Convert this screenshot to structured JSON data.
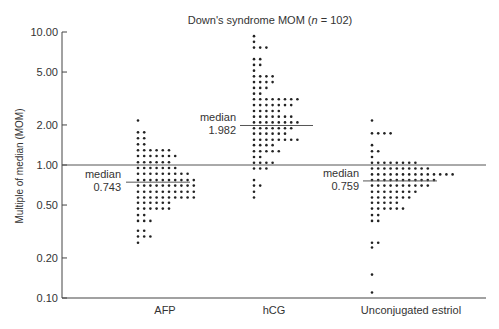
{
  "chart_data": {
    "type": "scatter",
    "subtype": "dot-strip (log scale)",
    "title": "Down's syndrome MOM (n = 102)",
    "title_parts": {
      "prefix": "Down's syndrome MOM (",
      "n": "n",
      "suffix": " = 102)"
    },
    "xlabel": "",
    "ylabel": "Multiple of median (MOM)",
    "yscale": "log",
    "ylim": [
      0.1,
      10.0
    ],
    "yticks": [
      10.0,
      5.0,
      2.0,
      1.0,
      0.5,
      0.2,
      0.1
    ],
    "ytick_labels": [
      "10.00",
      "5.00",
      "2.00",
      "1.00",
      "0.50",
      "0.20",
      "0.10"
    ],
    "reference_line": 1.0,
    "grid": false,
    "legend": null,
    "categories": [
      "AFP",
      "hCG",
      "Unconjugated estriol"
    ],
    "series": [
      {
        "name": "AFP",
        "median": 0.743,
        "median_label": "median",
        "median_value_label": "0.743",
        "rows": [
          {
            "value": 2.16,
            "count": 1
          },
          {
            "value": 1.76,
            "count": 2
          },
          {
            "value": 1.59,
            "count": 2
          },
          {
            "value": 1.43,
            "count": 2
          },
          {
            "value": 1.29,
            "count": 6
          },
          {
            "value": 1.17,
            "count": 7
          },
          {
            "value": 1.05,
            "count": 6
          },
          {
            "value": 0.95,
            "count": 7
          },
          {
            "value": 0.86,
            "count": 9
          },
          {
            "value": 0.77,
            "count": 10
          },
          {
            "value": 0.7,
            "count": 10
          },
          {
            "value": 0.63,
            "count": 10
          },
          {
            "value": 0.57,
            "count": 10
          },
          {
            "value": 0.52,
            "count": 6
          },
          {
            "value": 0.47,
            "count": 6
          },
          {
            "value": 0.42,
            "count": 2
          },
          {
            "value": 0.38,
            "count": 3
          },
          {
            "value": 0.32,
            "count": 2
          },
          {
            "value": 0.29,
            "count": 3
          },
          {
            "value": 0.26,
            "count": 1
          }
        ]
      },
      {
        "name": "hCG",
        "median": 1.982,
        "median_label": "median",
        "median_value_label": "1.982",
        "rows": [
          {
            "value": 9.31,
            "count": 1
          },
          {
            "value": 8.43,
            "count": 1
          },
          {
            "value": 7.63,
            "count": 3
          },
          {
            "value": 6.25,
            "count": 2
          },
          {
            "value": 5.66,
            "count": 2
          },
          {
            "value": 5.12,
            "count": 1
          },
          {
            "value": 4.64,
            "count": 4
          },
          {
            "value": 4.2,
            "count": 4
          },
          {
            "value": 3.8,
            "count": 3
          },
          {
            "value": 3.44,
            "count": 2
          },
          {
            "value": 3.12,
            "count": 8
          },
          {
            "value": 2.82,
            "count": 7
          },
          {
            "value": 2.55,
            "count": 5
          },
          {
            "value": 2.31,
            "count": 7
          },
          {
            "value": 2.09,
            "count": 8
          },
          {
            "value": 1.89,
            "count": 7
          },
          {
            "value": 1.72,
            "count": 6
          },
          {
            "value": 1.55,
            "count": 8
          },
          {
            "value": 1.41,
            "count": 4
          },
          {
            "value": 1.27,
            "count": 5
          },
          {
            "value": 1.15,
            "count": 2
          },
          {
            "value": 1.04,
            "count": 4
          },
          {
            "value": 0.94,
            "count": 3
          },
          {
            "value": 0.77,
            "count": 1
          },
          {
            "value": 0.7,
            "count": 2
          },
          {
            "value": 0.63,
            "count": 1
          },
          {
            "value": 0.57,
            "count": 1
          }
        ]
      },
      {
        "name": "Unconjugated estriol",
        "median": 0.759,
        "median_label": "median",
        "median_value_label": "0.759",
        "rows": [
          {
            "value": 2.16,
            "count": 1
          },
          {
            "value": 1.73,
            "count": 4
          },
          {
            "value": 1.41,
            "count": 1
          },
          {
            "value": 1.27,
            "count": 2
          },
          {
            "value": 1.15,
            "count": 1
          },
          {
            "value": 1.04,
            "count": 8
          },
          {
            "value": 0.94,
            "count": 10
          },
          {
            "value": 0.85,
            "count": 14
          },
          {
            "value": 0.77,
            "count": 11
          },
          {
            "value": 0.7,
            "count": 10
          },
          {
            "value": 0.63,
            "count": 8
          },
          {
            "value": 0.57,
            "count": 7
          },
          {
            "value": 0.52,
            "count": 5
          },
          {
            "value": 0.47,
            "count": 6
          },
          {
            "value": 0.42,
            "count": 2
          },
          {
            "value": 0.38,
            "count": 2
          },
          {
            "value": 0.26,
            "count": 2
          },
          {
            "value": 0.24,
            "count": 1
          },
          {
            "value": 0.15,
            "count": 1
          },
          {
            "value": 0.11,
            "count": 1
          }
        ]
      }
    ]
  },
  "layout": {
    "plot_left": 62,
    "plot_right": 486,
    "y_top_value": 10,
    "y_top_px": 32,
    "px_per_decade": 133,
    "dot_spacing_x": 6.2,
    "dot_radius": 1.3,
    "columns": [
      {
        "dot_start_x": 138,
        "median_line_x1": 126,
        "median_line_x2": 190,
        "median_label_x": 121,
        "cat_label_x": 165
      },
      {
        "dot_start_x": 254,
        "median_line_x1": 240,
        "median_line_x2": 313,
        "median_label_x": 236,
        "cat_label_x": 274
      },
      {
        "dot_start_x": 372,
        "median_line_x1": 363,
        "median_line_x2": 437,
        "median_label_x": 359,
        "cat_label_x": 411
      }
    ]
  },
  "colors": {
    "ink": "#333333",
    "dots": "#222222",
    "axis": "#444444",
    "median_line": "#555555",
    "background": "#ffffff"
  }
}
